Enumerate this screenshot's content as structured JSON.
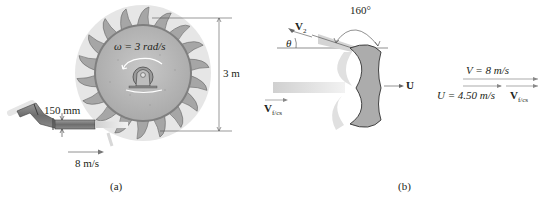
{
  "figure_a": {
    "caption": "(a)",
    "omega_label": "ω = 3 rad/s",
    "diameter_label": "3 m",
    "nozzle_label": "150 mm",
    "jet_speed_label": "8 m/s",
    "colors": {
      "wheel": "#b9b9b9",
      "blade": "#a9a9a9",
      "pipe": "#7d7d7d",
      "jet": "#d6d6d6"
    }
  },
  "figure_b": {
    "caption": "(b)",
    "v2_label": "V",
    "v2_sub": "2",
    "theta_label": "θ",
    "angle_label": "160°",
    "u_label": "U",
    "vfcs_label": "V",
    "vfcs_sub": "f/cs",
    "colors": {
      "bucket": "#b0b0b0",
      "jet": "#dcdcdc"
    }
  },
  "velocity_diagram": {
    "v_label": "V = 8 m/s",
    "u_label": "U = 4.50 m/s",
    "vfcs_label": "V",
    "vfcs_sub": "f/cs"
  }
}
